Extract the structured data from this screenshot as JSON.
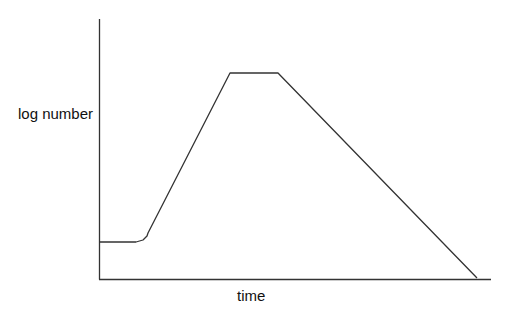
{
  "chart_data": {
    "type": "line",
    "title": "",
    "xlabel": "time",
    "ylabel": "log number",
    "grid": false,
    "legend": null,
    "x_ticks": [],
    "y_ticks": [],
    "series": [
      {
        "name": "growth curve",
        "color": "#333333",
        "points_px": [
          [
            99,
            242
          ],
          [
            136,
            242
          ],
          [
            143,
            240
          ],
          [
            147,
            236
          ],
          [
            148,
            233
          ],
          [
            230,
            73
          ],
          [
            278,
            73
          ],
          [
            477,
            278
          ]
        ],
        "phases": [
          "lag",
          "exponential",
          "stationary",
          "death"
        ]
      }
    ],
    "axes": {
      "origin_px": [
        99,
        279
      ],
      "y_top_px": 19,
      "x_end_px": 491,
      "color": "#333333"
    }
  }
}
